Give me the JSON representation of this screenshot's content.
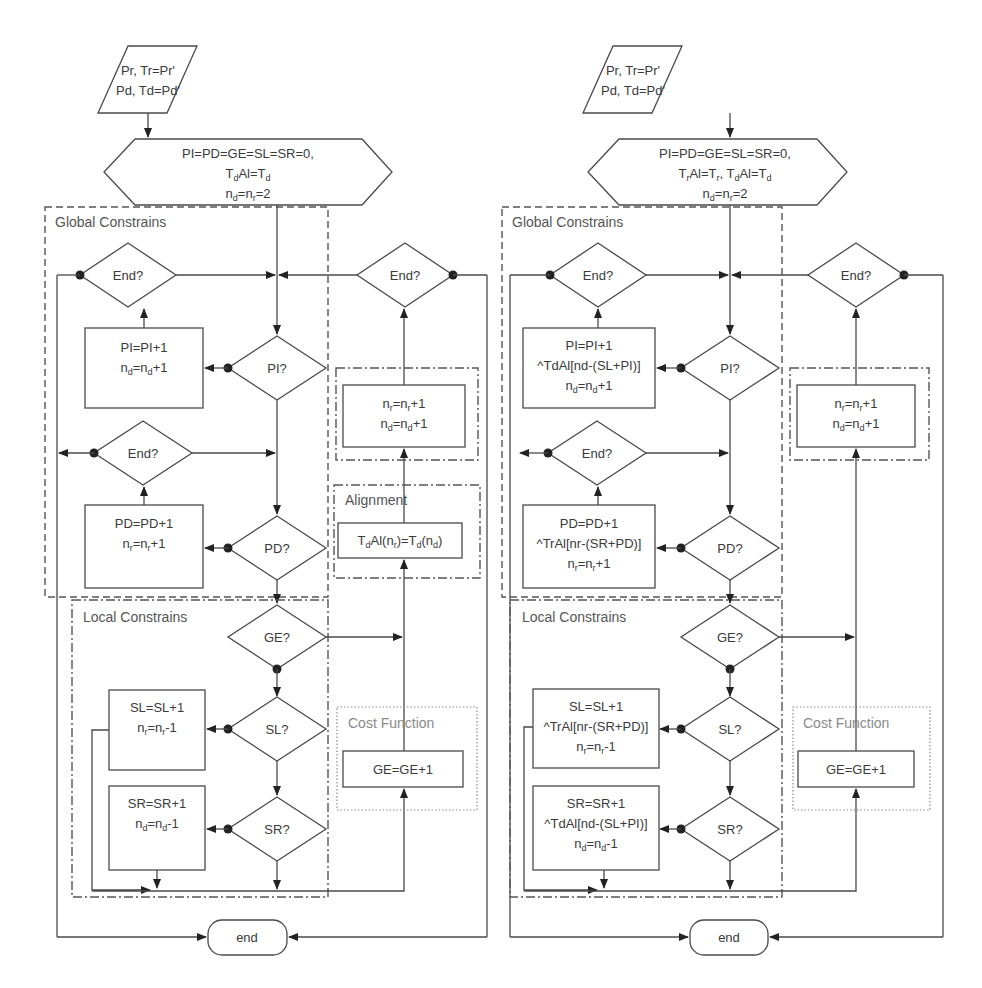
{
  "figure": {
    "background_text_lines": [
      "faded body text (illegible)",
      "faded body text (illegible)"
    ]
  },
  "flowcharts": [
    {
      "id": "left",
      "input": {
        "line1": "Pr, Tr=Pr'",
        "line2": "Pd, Td=Pd'"
      },
      "init": {
        "line1": "PI=PD=GE=SL=SR=0,",
        "line2": "TdAl=Td",
        "line3": "nd=nr=2"
      },
      "regions": {
        "global": "Global Constrains",
        "local": "Local Constrains",
        "alignment": "Alignment",
        "cost": "Cost Function"
      },
      "decisions": {
        "end_top_left": "End?",
        "end_top_right": "End?",
        "pi": "PI?",
        "end_mid": "End?",
        "pd": "PD?",
        "ge": "GE?",
        "sl": "SL?",
        "sr": "SR?"
      },
      "process": {
        "pi_box": [
          "PI=PI+1",
          "nd=nd+1"
        ],
        "pd_box": [
          "PD=PD+1",
          "nr=nr+1"
        ],
        "nr_nd_box": [
          "nr=nr+1",
          "nd=nd+1"
        ],
        "alignment_box": [
          "TdAl(nr)=Td(nd)"
        ],
        "sl_box": [
          "SL=SL+1",
          "nr=nr-1"
        ],
        "sr_box": [
          "SR=SR+1",
          "nd=nd-1"
        ],
        "ge_box": [
          "GE=GE+1"
        ]
      },
      "terminator": "end"
    },
    {
      "id": "right",
      "input": {
        "line1": "Pr, Tr=Pr'",
        "line2": "Pd, Td=Pd'"
      },
      "init": {
        "line1": "PI=PD=GE=SL=SR=0,",
        "line2": "TrAl=Tr, TdAl=Td",
        "line3": "nd=nr=2"
      },
      "regions": {
        "global": "Global Constrains",
        "local": "Local Constrains",
        "cost": "Cost Function"
      },
      "decisions": {
        "end_top_left": "End?",
        "end_top_right": "End?",
        "pi": "PI?",
        "end_mid": "End?",
        "pd": "PD?",
        "ge": "GE?",
        "sl": "SL?",
        "sr": "SR?"
      },
      "process": {
        "pi_box": [
          "PI=PI+1",
          "^TdAl[nd-(SL+PI)]",
          "nd=nd+1"
        ],
        "pd_box": [
          "PD=PD+1",
          "^TrAl[nr-(SR+PD)]",
          "nr=nr+1"
        ],
        "nr_nd_box": [
          "nr=nr+1",
          "nd=nd+1"
        ],
        "sl_box": [
          "SL=SL+1",
          "^TrAl[nr-(SR+PD)]",
          "nr=nr-1"
        ],
        "sr_box": [
          "SR=SR+1",
          "^TdAl[nd-(SL+PI)]",
          "nd=nd-1"
        ],
        "ge_box": [
          "GE=GE+1"
        ]
      },
      "terminator": "end"
    }
  ],
  "colors": {
    "stroke": "#4a4a4a",
    "region_label": "#555555",
    "cost_label": "#8a8a8a",
    "background": "#ffffff"
  }
}
